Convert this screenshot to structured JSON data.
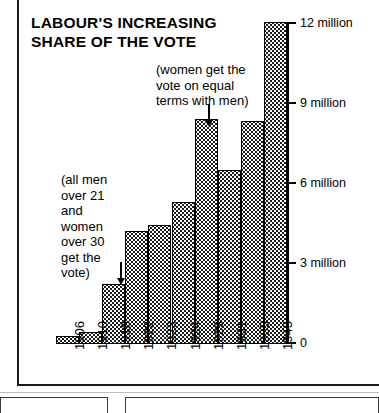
{
  "chart_data": {
    "type": "bar",
    "title": "LABOUR'S INCREASING SHARE OF THE VOTE",
    "title_lines": [
      "LABOUR'S INCREASING",
      "SHARE OF THE VOTE"
    ],
    "xlabel": "",
    "ylabel": "",
    "categories": [
      "1906",
      "1910",
      "1918",
      "1922",
      "1923",
      "1924",
      "1929",
      "1931",
      "1935",
      "1945"
    ],
    "values": [
      0.3,
      0.45,
      2.25,
      4.2,
      4.45,
      5.3,
      8.4,
      6.5,
      8.3,
      12.0
    ],
    "ylim": [
      0,
      12
    ],
    "y_ticks": [
      0,
      3,
      6,
      9,
      12
    ],
    "y_tick_labels": [
      "0",
      "3 million",
      "6 million",
      "9 million",
      "12 million"
    ],
    "grid": false,
    "legend": null,
    "annotations": [
      {
        "id": "women-vote",
        "lines": [
          "(women get the",
          "vote on equal",
          "terms with men)"
        ],
        "points_to": "1929"
      },
      {
        "id": "men-and-women-vote",
        "lines": [
          "(all men",
          "over 21",
          "and",
          "women",
          "over 30",
          "get the",
          "vote)"
        ],
        "points_to": "1918"
      }
    ],
    "colors": {
      "bar_fill": "#ffffff",
      "bar_pattern": "#1b1b1b",
      "axis": "#000000",
      "text": "#000000",
      "background": "#ffffff"
    }
  }
}
